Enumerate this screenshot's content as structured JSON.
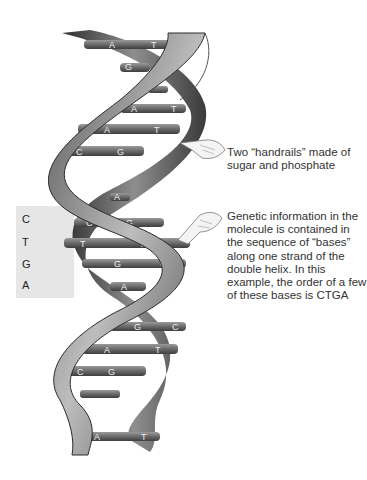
{
  "diagram": {
    "callouts": {
      "handrails": "Two “handrails” made of sugar and phosphate",
      "genetic_info": "Genetic information in the molecule is contained in the sequence of “bases” along one strand of the double helix. In this example, the order of a few of these bases is CTGA"
    },
    "sequence_box": {
      "letters": [
        "C",
        "T",
        "G",
        "A"
      ]
    },
    "base_pairs": [
      {
        "left": "A",
        "right": "T"
      },
      {
        "left": "G",
        "right": ""
      },
      {
        "left": "",
        "right": ""
      },
      {
        "left": "A",
        "right": "T"
      },
      {
        "left": "A",
        "right": "T"
      },
      {
        "left": "C",
        "right": "G"
      },
      {
        "left": "A",
        "right": ""
      },
      {
        "left": "C",
        "right": "G"
      },
      {
        "left": "T",
        "right": "A"
      },
      {
        "left": "G",
        "right": "C"
      },
      {
        "left": "A",
        "right": ""
      },
      {
        "left": "G",
        "right": "C"
      },
      {
        "left": "A",
        "right": "T"
      },
      {
        "left": "C",
        "right": "G"
      },
      {
        "left": "",
        "right": ""
      },
      {
        "left": "A",
        "right": "T"
      }
    ],
    "colors": {
      "strand_dark": "#3a3a3a",
      "strand_light": "#9a9a9a",
      "base_bar": "#6b6b6b",
      "sequence_bg": "#e6e6e6",
      "text": "#333333"
    }
  }
}
